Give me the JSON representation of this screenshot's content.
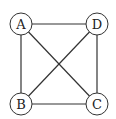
{
  "diagram": {
    "type": "graph",
    "title": "",
    "nodes": [
      {
        "id": "A",
        "label": "A",
        "x": 21,
        "y": 24
      },
      {
        "id": "D",
        "label": "D",
        "x": 97,
        "y": 24
      },
      {
        "id": "B",
        "label": "B",
        "x": 21,
        "y": 104
      },
      {
        "id": "C",
        "label": "C",
        "x": 97,
        "y": 104
      }
    ],
    "edges": [
      {
        "from": "A",
        "to": "D"
      },
      {
        "from": "A",
        "to": "B"
      },
      {
        "from": "A",
        "to": "C"
      },
      {
        "from": "D",
        "to": "B"
      },
      {
        "from": "D",
        "to": "C"
      },
      {
        "from": "B",
        "to": "C"
      }
    ],
    "node_radius": 11,
    "colors": {
      "stroke": "#333333",
      "fill": "#ffffff",
      "text": "#222222"
    }
  }
}
